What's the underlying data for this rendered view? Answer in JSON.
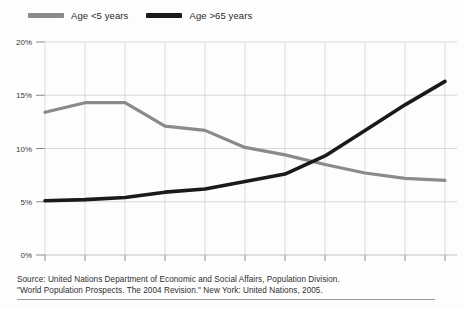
{
  "legend": {
    "entries": [
      {
        "label": "Age <5 years",
        "color": "#8a8a8a",
        "icon": "line-swatch-icon"
      },
      {
        "label": "Age >65 years",
        "color": "#1a1a1a",
        "icon": "line-swatch-icon"
      }
    ]
  },
  "caption": {
    "line1": "Source: United Nations Department of Economic and Social Affairs, Population Division.",
    "line2": "\"World Population Prospects. The 2004 Revision.\" New York: United Nations, 2005."
  },
  "chart_data": {
    "type": "line",
    "title": "",
    "subtitle": "",
    "xlabel": "",
    "ylabel": "",
    "x": [
      1950,
      1960,
      1970,
      1980,
      1990,
      2000,
      2010,
      2020,
      2030,
      2040,
      2050
    ],
    "xtick_labels": [
      "1950",
      "1960",
      "1970",
      "1980",
      "1990",
      "2000",
      "2010",
      "2020",
      "2030",
      "2040",
      "2050"
    ],
    "xlim": [
      1950,
      2050
    ],
    "ylim": [
      0,
      20
    ],
    "ytick_values": [
      0,
      5,
      10,
      15,
      20
    ],
    "ytick_labels": [
      "0%",
      "5%",
      "10%",
      "15%",
      "20%"
    ],
    "grid": true,
    "legend_position": "top-left",
    "series": [
      {
        "name": "Age <5 years",
        "color": "#8a8a8a",
        "values": [
          13.4,
          14.3,
          14.3,
          12.1,
          11.7,
          10.1,
          9.4,
          8.5,
          7.7,
          7.2,
          7.0
        ]
      },
      {
        "name": "Age >65 years",
        "color": "#1a1a1a",
        "values": [
          5.1,
          5.2,
          5.4,
          5.9,
          6.2,
          6.9,
          7.6,
          9.3,
          11.7,
          14.1,
          16.3
        ]
      }
    ],
    "annotations": [
      {
        "text": "crossover",
        "x": 2015,
        "y": 8.5
      }
    ]
  }
}
